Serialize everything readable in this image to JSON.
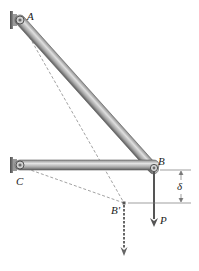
{
  "diagram": {
    "colors": {
      "bar_light": "#d8d8d8",
      "bar_mid": "#9a9a9a",
      "bar_dark": "#555555",
      "wall": "#6b6b6b",
      "dashed": "#8a8a8a",
      "arrow": "#555555",
      "text": "#222222"
    },
    "labels": {
      "A": "A",
      "B": "B",
      "C": "C",
      "B_prime": "B'",
      "P": "P",
      "delta": "δ"
    },
    "points": {
      "A": [
        20,
        20
      ],
      "C": [
        20,
        165
      ],
      "B": [
        154,
        170
      ],
      "B_prime": [
        124,
        203
      ]
    },
    "members": [
      {
        "name": "AB",
        "from": "A",
        "to": "B"
      },
      {
        "name": "CB",
        "from": "C",
        "to": "B"
      }
    ],
    "load": {
      "name": "P",
      "at": "B",
      "direction": "down"
    }
  }
}
